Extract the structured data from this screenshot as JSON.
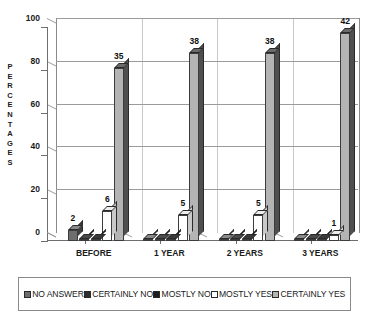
{
  "chart_data": {
    "type": "bar",
    "title": "",
    "subtitle": "",
    "xlabel": "",
    "ylabel": "PERCENTAGES",
    "ylim": [
      0,
      100
    ],
    "yticks": [
      0,
      20,
      40,
      60,
      80,
      100
    ],
    "grid": true,
    "legend_position": "bottom",
    "style": "3d-columns-grayscale",
    "categories": [
      "BEFORE",
      "1 YEAR",
      "2 YEARS",
      "3 YEARS"
    ],
    "value_unit": "percent",
    "label_unit": "count",
    "note": "Bar heights are percentages; printed data labels are respondent counts.",
    "series": [
      {
        "name": "NO ANSWER",
        "color": "#6e6e6e",
        "values": [
          5,
          1,
          1,
          1
        ],
        "labels": [
          "2",
          "",
          "",
          ""
        ]
      },
      {
        "name": "CERTAINLY NO",
        "color": "#2e2e2e",
        "values": [
          1,
          1,
          1,
          1
        ],
        "labels": [
          "",
          "",
          "",
          ""
        ]
      },
      {
        "name": "MOSTLY NO",
        "color": "#1d1d1d",
        "values": [
          1,
          1,
          1,
          1
        ],
        "labels": [
          "",
          "",
          "",
          ""
        ]
      },
      {
        "name": "MOSTLY YES",
        "color": "#ffffff",
        "values": [
          14,
          12,
          12,
          3
        ],
        "labels": [
          "6",
          "5",
          "5",
          "1"
        ]
      },
      {
        "name": "CERTAINLY YES",
        "color": "#b4b4b4",
        "values": [
          81,
          88,
          88,
          97
        ],
        "labels": [
          "35",
          "38",
          "38",
          "42"
        ]
      }
    ]
  },
  "axis": {
    "y_title_letters": [
      "P",
      "E",
      "R",
      "C",
      "E",
      "N",
      "T",
      "A",
      "G",
      "E",
      "S"
    ]
  },
  "legend": {
    "items": [
      {
        "label": "NO ANSWER",
        "color": "#6e6e6e"
      },
      {
        "label": "CERTAINLY NO",
        "color": "#2e2e2e"
      },
      {
        "label": "MOSTLY NO",
        "color": "#1d1d1d"
      },
      {
        "label": "MOSTLY YES",
        "color": "#ffffff"
      },
      {
        "label": "CERTAINLY YES",
        "color": "#b4b4b4"
      }
    ]
  }
}
